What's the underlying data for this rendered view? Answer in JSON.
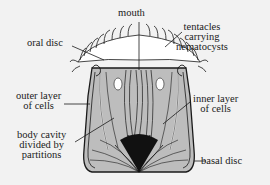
{
  "diagram": {
    "background": "#f2f2f2",
    "body_fill": "#b8b8b8",
    "outline_color": "#1a1a1a",
    "labels": {
      "mouth": "mouth",
      "oral_disc": "oral disc",
      "tentacles_line1": "tentacles",
      "tentacles_line2": "carrying",
      "tentacles_line3": "nematocysts",
      "outer_layer_line1": "outer layer",
      "outer_layer_line2": "of cells",
      "inner_layer_line1": "inner layer",
      "inner_layer_line2": "of cells",
      "body_cavity_line1": "body cavity",
      "body_cavity_line2": "divided by",
      "body_cavity_line3": "partitions",
      "basal_disc": "basal disc"
    }
  }
}
